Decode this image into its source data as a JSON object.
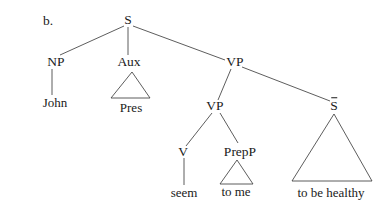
{
  "example_label": "b.",
  "tree": {
    "nodes": {
      "S": "S",
      "NP": "NP",
      "Aux": "Aux",
      "VP_top": "VP",
      "VP_inner": "VP",
      "S_bar": "S",
      "V": "V",
      "PrepP": "PrepP"
    },
    "leaves": {
      "john": "John",
      "pres": "Pres",
      "seem": "seem",
      "to_me": "to me",
      "to_be_healthy": "to be healthy"
    },
    "structure": "[S [NP John] [Aux Pres(triangle)] [VP [VP [V seem] [PrepP to me(triangle)]] [S-bar to be healthy(triangle)]]]"
  },
  "colors": {
    "text": "#1a1a1a",
    "lines": "#333333",
    "background": "#ffffff"
  }
}
